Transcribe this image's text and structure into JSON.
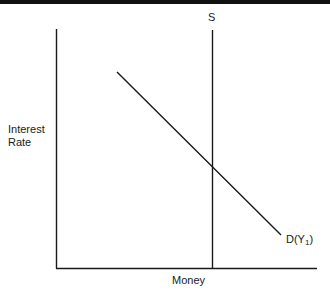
{
  "diagram": {
    "type": "money-market",
    "y_axis_label_line1": "Interest",
    "y_axis_label_line2": "Rate",
    "x_axis_label": "Money",
    "supply_curve": {
      "label": "S",
      "orientation": "vertical"
    },
    "demand_curve": {
      "label_prefix": "D(Y",
      "label_subscript": "1",
      "label_suffix": ")",
      "orientation": "downward-sloping"
    },
    "colors": {
      "line": "#1a1a1a",
      "background": "#ffffff"
    }
  }
}
